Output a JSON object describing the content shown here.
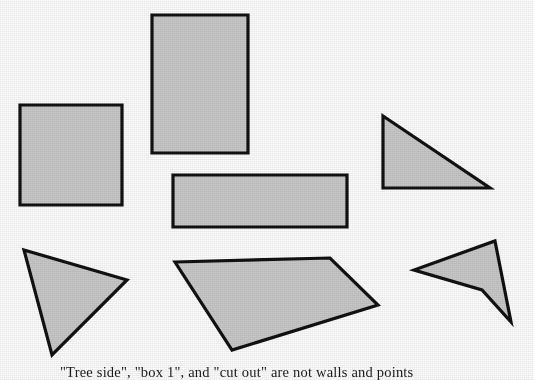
{
  "figure": {
    "background_color": "#fdfdfd",
    "fill_color": "#c8c8c8",
    "stroke_color": "#111111",
    "width": 534,
    "height": 380,
    "caption": "\"Tree side\", \"box 1\", and \"cut out\" are not walls and points"
  },
  "shapes": [
    {
      "name": "square",
      "kind": "rectangle",
      "points": "20,105 122,105 122,205 20,205"
    },
    {
      "name": "tall-rectangle",
      "kind": "rectangle",
      "points": "152,15 248,15 248,153 152,153"
    },
    {
      "name": "wide-rectangle",
      "kind": "rectangle",
      "points": "173,175 347,175 347,227 173,227"
    },
    {
      "name": "right-triangle",
      "kind": "triangle",
      "points": "383,116 490,188 383,188"
    },
    {
      "name": "left-triangle",
      "kind": "triangle",
      "points": "24,250 127,280 52,355"
    },
    {
      "name": "quadrilateral",
      "kind": "quadrilateral",
      "points": "175,262 330,258 378,305 232,350"
    },
    {
      "name": "arrow-dart",
      "kind": "concave-quadrilateral",
      "points": "495,241 511,322 482,290 414,270"
    }
  ]
}
